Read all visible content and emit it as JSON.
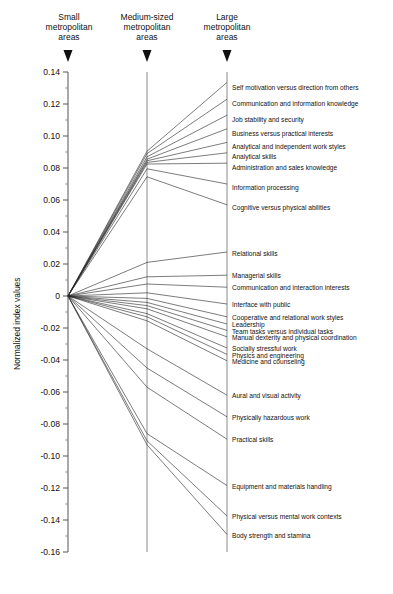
{
  "chart_data": {
    "type": "line",
    "title": "",
    "subtitle": "",
    "xlabel": "",
    "ylabel": "Normalized index values",
    "ylim": [
      -0.16,
      0.14
    ],
    "ytick_step": 0.02,
    "grid": false,
    "legend_position": "none",
    "categories": [
      "Small metropolitan areas",
      "Medium-sized metropolitan areas",
      "Large metropolitan areas"
    ],
    "yticks": [
      "0.14",
      "0.12",
      "0.10",
      "0.08",
      "0.06",
      "0.04",
      "0.02",
      "0",
      "-0.02",
      "-0.04",
      "-0.06",
      "-0.08",
      "-0.10",
      "-0.12",
      "-0.14",
      "-0.16"
    ],
    "ytick_values": [
      0.14,
      0.12,
      0.1,
      0.08,
      0.06,
      0.04,
      0.02,
      0,
      -0.02,
      -0.04,
      -0.06,
      -0.08,
      -0.1,
      -0.12,
      -0.14,
      -0.16
    ],
    "series": [
      {
        "name": "Self motivation versus direction from others",
        "values": [
          0.0,
          0.0905,
          0.1335
        ],
        "label_y": 0.1305
      },
      {
        "name": "Communication and information knowledge",
        "values": [
          0.0,
          0.089,
          0.123
        ],
        "label_y": 0.12
      },
      {
        "name": "Job stability and security",
        "values": [
          0.0,
          0.087,
          0.113
        ],
        "label_y": 0.11
      },
      {
        "name": "Business versus practical interests",
        "values": [
          0.0,
          0.0855,
          0.1045
        ],
        "label_y": 0.1015
      },
      {
        "name": "Analytical and independent work styles",
        "values": [
          0.0,
          0.0845,
          0.096
        ],
        "label_y": 0.0935
      },
      {
        "name": "Analytical skills",
        "values": [
          0.0,
          0.0835,
          0.0895
        ],
        "label_y": 0.087
      },
      {
        "name": "Administration and sales knowledge",
        "values": [
          0.0,
          0.0825,
          0.083
        ],
        "label_y": 0.0805
      },
      {
        "name": "Information processing",
        "values": [
          0.0,
          0.0795,
          0.07
        ],
        "label_y": 0.068
      },
      {
        "name": "Cognitive versus physical abilities",
        "values": [
          0.0,
          0.0745,
          0.057
        ],
        "label_y": 0.055
      },
      {
        "name": "Relational skills",
        "values": [
          0.0,
          0.021,
          0.0275
        ],
        "label_y": 0.0265
      },
      {
        "name": "Managerial skills",
        "values": [
          0.0,
          0.012,
          0.013
        ],
        "label_y": 0.0125
      },
      {
        "name": "Communication and interaction interests",
        "values": [
          0.0,
          0.0075,
          0.0055
        ],
        "label_y": 0.005
      },
      {
        "name": "Interface with public",
        "values": [
          0.0,
          0.002,
          -0.005
        ],
        "label_y": -0.0055
      },
      {
        "name": "Cooperative and relational work styles",
        "values": [
          0.0,
          -0.0015,
          -0.013
        ],
        "label_y": -0.0135
      },
      {
        "name": "Leadership",
        "values": [
          0.0,
          -0.004,
          -0.0175
        ],
        "label_y": -0.018
      },
      {
        "name": "Team tasks versus individual tasks",
        "values": [
          0.0,
          -0.006,
          -0.0215
        ],
        "label_y": -0.022
      },
      {
        "name": "Manual dexterity and physical coordination",
        "values": [
          0.0,
          -0.008,
          -0.0255
        ],
        "label_y": -0.026
      },
      {
        "name": "Socially stressful work",
        "values": [
          0.0,
          -0.011,
          -0.0325
        ],
        "label_y": -0.033
      },
      {
        "name": "Physics and engineering",
        "values": [
          0.0,
          -0.013,
          -0.0365
        ],
        "label_y": -0.037
      },
      {
        "name": "Medicine and counseling",
        "values": [
          0.0,
          -0.0155,
          -0.0405
        ],
        "label_y": -0.041
      },
      {
        "name": "Aural and visual activity",
        "values": [
          0.0,
          -0.033,
          -0.062
        ],
        "label_y": -0.0625
      },
      {
        "name": "Physically hazardous work",
        "values": [
          0.0,
          -0.045,
          -0.0755
        ],
        "label_y": -0.076
      },
      {
        "name": "Practical skills",
        "values": [
          0.0,
          -0.057,
          -0.0895
        ],
        "label_y": -0.09
      },
      {
        "name": "Equipment and materials handling",
        "values": [
          0.0,
          -0.086,
          -0.1185
        ],
        "label_y": -0.119
      },
      {
        "name": "Physical versus mental work contexts",
        "values": [
          0.0,
          -0.0905,
          -0.1375
        ],
        "label_y": -0.138
      },
      {
        "name": "Body strength and stamina",
        "values": [
          0.0,
          -0.093,
          -0.149
        ],
        "label_y": -0.1495
      }
    ]
  },
  "headers": [
    {
      "line1": "Small",
      "line2": "metropolitan",
      "line3": "areas"
    },
    {
      "line1": "Medium-sized",
      "line2": "metropolitan",
      "line3": "areas"
    },
    {
      "line1": "Large",
      "line2": "metropolitan",
      "line3": "areas"
    }
  ],
  "axis": {
    "y_title": "Normalized index values"
  }
}
